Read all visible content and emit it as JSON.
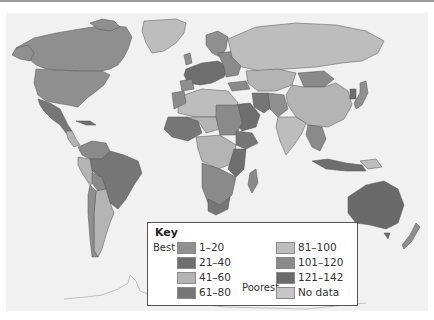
{
  "map": {
    "type": "choropleth world map",
    "background": "#f1f1f1",
    "ocean": "#f1f1f1"
  },
  "key": {
    "title": "Key",
    "best_label": "Best",
    "poorest_label": "Poorest",
    "ranges": [
      {
        "label": "1–20",
        "color": "#8f8f8f"
      },
      {
        "label": "21–40",
        "color": "#6e6e6e"
      },
      {
        "label": "41–60",
        "color": "#b4b4b4"
      },
      {
        "label": "61–80",
        "color": "#767676"
      },
      {
        "label": "81–100",
        "color": "#bdbdbd"
      },
      {
        "label": "101–120",
        "color": "#8a8a8a"
      },
      {
        "label": "121–142",
        "color": "#6a6a6a"
      },
      {
        "label": "No data",
        "color": "#c6c6c6"
      }
    ]
  }
}
